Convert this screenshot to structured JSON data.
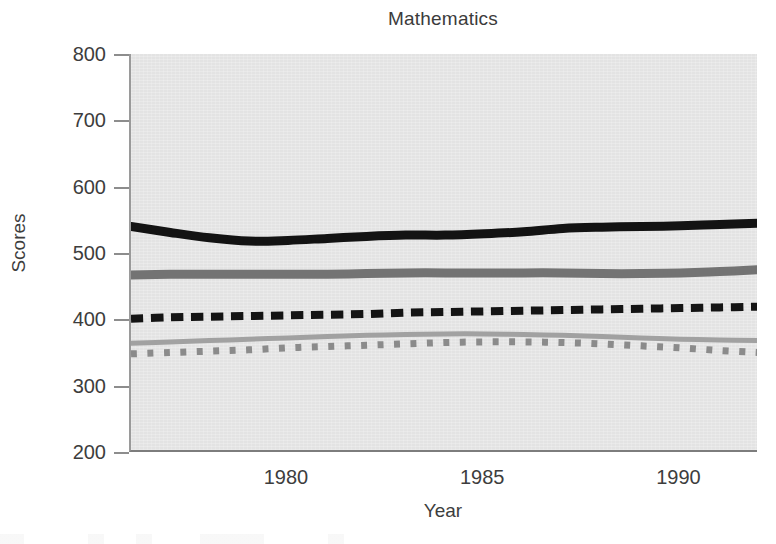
{
  "chart_data": {
    "type": "line",
    "title": "Mathematics",
    "xlabel": "Year",
    "ylabel": "Scores",
    "xlim": [
      1976,
      1992
    ],
    "ylim": [
      200,
      800
    ],
    "xticks": [
      1980,
      1985,
      1990
    ],
    "yticks": [
      200,
      300,
      400,
      500,
      600,
      700,
      800
    ],
    "xtick_labels": [
      "1980",
      "1985",
      "1990"
    ],
    "ytick_labels": [
      "200",
      "300",
      "400",
      "500",
      "600",
      "700",
      "800"
    ],
    "grid": false,
    "legend": "none",
    "plot_background": "#e3e3e3",
    "x": [
      1976,
      1977,
      1978,
      1979,
      1980,
      1981,
      1982,
      1983,
      1984,
      1985,
      1986,
      1987,
      1988,
      1989,
      1990,
      1991,
      1992
    ],
    "series": [
      {
        "name": "series-1-solid-black",
        "style": "solid",
        "color": "#131313",
        "width": 9,
        "values": [
          540,
          531,
          523,
          518,
          519,
          522,
          525,
          527,
          527,
          529,
          532,
          537,
          539,
          540,
          541,
          543,
          545
        ]
      },
      {
        "name": "series-2-solid-gray",
        "style": "solid",
        "color": "#737373",
        "width": 9,
        "values": [
          467,
          468,
          468,
          468,
          468,
          468,
          469,
          470,
          470,
          470,
          470,
          470,
          469,
          469,
          470,
          472,
          475
        ]
      },
      {
        "name": "series-3-dashed-black",
        "style": "dashed",
        "color": "#141414",
        "width": 8,
        "values": [
          401,
          403,
          404,
          405,
          406,
          407,
          408,
          410,
          411,
          412,
          413,
          414,
          415,
          416,
          417,
          418,
          419
        ]
      },
      {
        "name": "series-4-solid-lightgray",
        "style": "solid",
        "color": "#a1a1a1",
        "width": 5,
        "values": [
          364,
          366,
          368,
          370,
          372,
          374,
          376,
          377,
          378,
          378,
          377,
          376,
          374,
          372,
          370,
          369,
          368
        ]
      },
      {
        "name": "series-5-dotted-gray",
        "style": "dotted",
        "color": "#8b8b8b",
        "width": 7,
        "values": [
          348,
          350,
          352,
          354,
          357,
          359,
          361,
          363,
          365,
          366,
          366,
          365,
          363,
          360,
          357,
          353,
          350
        ]
      }
    ]
  }
}
